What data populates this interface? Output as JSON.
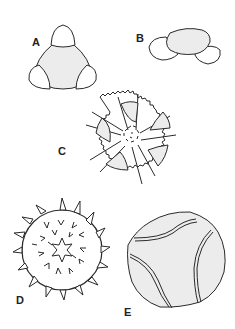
{
  "figure": {
    "panels": [
      {
        "id": "A",
        "label": "A",
        "description": "triangular grain with three rounded lobes (pores) at corners, shaded central body"
      },
      {
        "id": "B",
        "label": "B",
        "description": "side view of grain, shaded central body with lobes on both sides"
      },
      {
        "id": "C",
        "label": "C",
        "description": "circular grain with five spiny radiating ridges (star pattern) and finely dotted center"
      },
      {
        "id": "D",
        "label": "D",
        "description": "spherical echinate grain covered in spines with star-shaped center"
      },
      {
        "id": "E",
        "label": "E",
        "description": "rounded grain with three curved double-lined colpi"
      }
    ],
    "colors": {
      "stroke": "#2a2a2a",
      "fill_shaded": "#ececec",
      "background": "#ffffff"
    }
  }
}
